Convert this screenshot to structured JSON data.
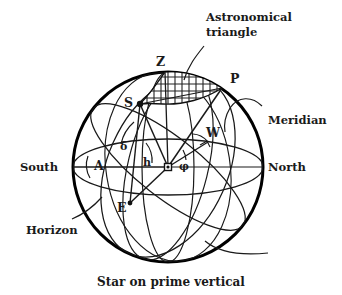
{
  "figure": {
    "caption": "Star on prime vertical",
    "annotation": {
      "line1": "Astronomical",
      "line2": "triangle"
    },
    "cardinal": {
      "south": "South",
      "north": "North"
    },
    "callouts": {
      "meridian": "Meridian",
      "horizon": "Horizon"
    },
    "points": {
      "zenith": "Z",
      "pole": "P",
      "star": "S",
      "east": "E",
      "west": "W"
    },
    "angles": {
      "azimuth": "A",
      "declination": "δ",
      "altitude": "h",
      "latitude": "φ"
    },
    "colors": {
      "ink": "#1a1a1a",
      "outline": "#000000",
      "hatch": "#222222",
      "background": "#ffffff"
    }
  }
}
